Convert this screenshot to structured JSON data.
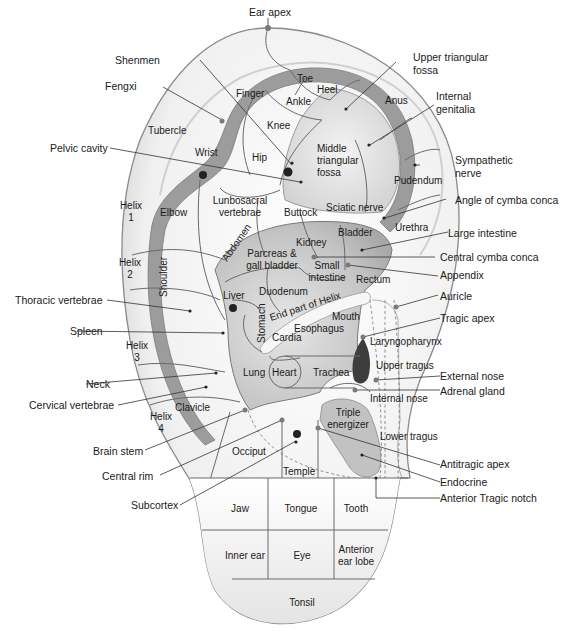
{
  "colors": {
    "ear_fill": "#f2f2f2",
    "ear_outline": "#8a8a8a",
    "concha_fill": "#c8c8c8",
    "fossa_fill": "#dcdcdc",
    "dark_region": "#3d3d3d",
    "line": "#6a6a6a"
  },
  "outer_labels": {
    "ear_apex": "Ear apex",
    "shenmen": "Shenmen",
    "fengxi": "Fengxi",
    "pelvic_cavity": "Pelvic cavity",
    "thoracic_vertebrae": "Thoracic vertebrae",
    "spleen": "Spleen",
    "neck": "Neck",
    "cervical_vertebrae": "Cervical vertebrae",
    "brain_stem": "Brain stem",
    "central_rim": "Central rim",
    "subcortex": "Subcortex",
    "upper_triangular_fossa": [
      "Upper triangular",
      "fossa"
    ],
    "internal_genitalia": [
      "Internal",
      "genitalia"
    ],
    "sympathetic_nerve": [
      "Sympathetic",
      "nerve"
    ],
    "angle_of_cymba_conca": "Angle of cymba conca",
    "large_intestine": "Large intestine",
    "central_cymba_conca": "Central  cymba conca",
    "appendix": "Appendix",
    "auricle": "Auricle",
    "tragic_apex": "Tragic apex",
    "external_nose": "External nose",
    "adrenal_gland": "Adrenal gland",
    "antitragic_apex": "Antitragic apex",
    "endocrine": "Endocrine",
    "anterior_tragic_notch": "Anterior Tragic notch"
  },
  "regions": {
    "toe": "Toe",
    "heel": "Heel",
    "ankle": "Ankle",
    "finger": "Finger",
    "knee": "Knee",
    "hip": "Hip",
    "anus": "Anus",
    "middle_triangular_fossa": [
      "Middle",
      "triangular",
      "fossa"
    ],
    "tubercle": "Tubercle",
    "wrist": "Wrist",
    "pudendum": "Pudendum",
    "helix1": [
      "Helix",
      "1"
    ],
    "helix2": [
      "Helix",
      "2"
    ],
    "helix3": [
      "Helix",
      "3"
    ],
    "helix4": [
      "Helix",
      "4"
    ],
    "elbow": "Elbow",
    "lunbosacral": [
      "Lunbosacral",
      "vertebrae"
    ],
    "buttock": "Buttock",
    "sciatic_nerve": "Sciatic nerve",
    "urethra": "Urethra",
    "abdomen": "Abdomen",
    "bladder": "Bladder",
    "kidney": "Kidney",
    "pancreas": [
      "Parcreas &",
      "gall bladder"
    ],
    "small_intestine": [
      "Small",
      "intestine"
    ],
    "rectum": "Rectum",
    "shoulder": "Shoulder",
    "liver": "Liver",
    "duodenum": "Duodenum",
    "end_part_of_helix": "End part of Helix",
    "stomach": "Stomach",
    "mouth": "Mouth",
    "esophagus": "Esophagus",
    "cardia": "Cardia",
    "laryngopharynx": "Laryngopharynx",
    "lung": "Lung",
    "heart": "Heart",
    "trachea": "Trachea",
    "upper_tragus": "Upper tragus",
    "internal_nose": "Internal nose",
    "clavicle": "Clavicle",
    "triple_energizer": [
      "Triple",
      "energizer"
    ],
    "occiput": "Occiput",
    "lower_tragus": "Lower tragus",
    "temple": "Temple"
  },
  "lobe_grid": {
    "rows": [
      [
        "Jaw",
        "Tongue",
        "Tooth"
      ],
      [
        "Inner ear",
        "Eye",
        "Anterior|ear lobe"
      ],
      [
        "Tonsil"
      ]
    ],
    "jaw": "Jaw",
    "tongue": "Tongue",
    "tooth": "Tooth",
    "inner_ear": "Inner ear",
    "eye": "Eye",
    "anterior_ear_lobe": [
      "Anterior",
      "ear lobe"
    ],
    "tonsil": "Tonsil"
  }
}
